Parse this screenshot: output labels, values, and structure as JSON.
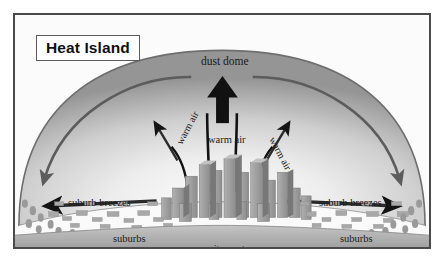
{
  "figure": {
    "title": "Heat Island",
    "type": "diagram"
  },
  "labels": {
    "dust_dome": "dust dome",
    "warm_air_center": "warm air",
    "warm_air_left": "warm air",
    "warm_air_right": "warm air",
    "suburb_breezes_left": "suburb breezes",
    "suburb_breezes_right": "suburb breezes",
    "suburbs_left": "suburbs",
    "suburbs_right": "suburbs",
    "city_center": "city center"
  },
  "colors": {
    "frame_border": "#4a4a4a",
    "background": "#fbfbfb",
    "dome_edge": "#6e6e6e",
    "dome_fill_dark": "#9a9a9a",
    "dome_fill_light": "#f2f2f2",
    "circulation_arrow": "#5c5c5c",
    "warm_air_arrow": "#111111",
    "building": "#9d9d9d",
    "building_shade": "#7c7c7c",
    "ground": "#b3b3b3",
    "title_text": "#111111"
  }
}
